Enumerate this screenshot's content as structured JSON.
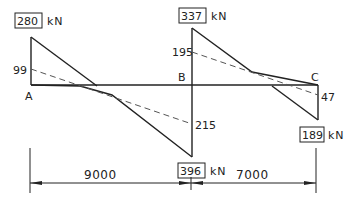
{
  "diagram": {
    "type": "shear force diagram",
    "supports": {
      "A": "A",
      "B": "B",
      "C": "C"
    },
    "values": {
      "A_max": "280",
      "A_dashed": "99",
      "B_left_max": "396",
      "B_left_dashed": "215",
      "B_right_max": "337",
      "B_right_dashed": "195",
      "C_max": "189",
      "C_dashed": "47"
    },
    "unit": "kN",
    "spans": {
      "AB": "9000",
      "BC": "7000"
    }
  }
}
